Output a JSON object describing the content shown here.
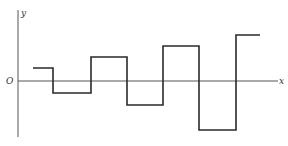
{
  "diagram": {
    "type": "step-waveform",
    "labels": {
      "x_axis": "x",
      "y_axis": "y",
      "origin": "O"
    },
    "axes": {
      "y_axis": {
        "x": 18,
        "y_top": 10,
        "y_bottom": 137
      },
      "x_axis": {
        "y": 81,
        "x_left": 18,
        "x_right": 278
      }
    },
    "waveform_points": [
      [
        33,
        68
      ],
      [
        53,
        68
      ],
      [
        53,
        93
      ],
      [
        91,
        93
      ],
      [
        91,
        57
      ],
      [
        127,
        57
      ],
      [
        127,
        105
      ],
      [
        163,
        105
      ],
      [
        163,
        46
      ],
      [
        199,
        46
      ],
      [
        199,
        130
      ],
      [
        236,
        130
      ],
      [
        236,
        35
      ],
      [
        260,
        35
      ]
    ],
    "segments": [
      {
        "x_start": 33,
        "x_end": 53,
        "level": "positive",
        "y": 68
      },
      {
        "x_start": 53,
        "x_end": 91,
        "level": "negative",
        "y": 93
      },
      {
        "x_start": 91,
        "x_end": 127,
        "level": "positive",
        "y": 57
      },
      {
        "x_start": 127,
        "x_end": 163,
        "level": "negative",
        "y": 105
      },
      {
        "x_start": 163,
        "x_end": 199,
        "level": "positive",
        "y": 46
      },
      {
        "x_start": 199,
        "x_end": 236,
        "level": "negative",
        "y": 130
      },
      {
        "x_start": 236,
        "x_end": 260,
        "level": "positive",
        "y": 35
      }
    ],
    "colors": {
      "axis": "#555555",
      "wave": "#2a2a2a",
      "label": "#333333",
      "background": "#ffffff"
    }
  }
}
